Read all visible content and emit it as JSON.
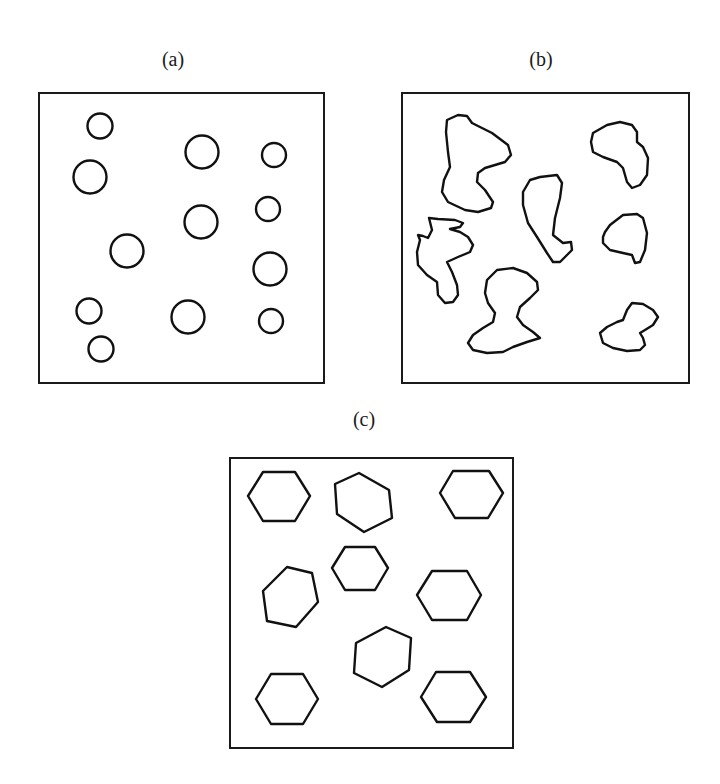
{
  "figure": {
    "stroke_color": "#111111",
    "background": "#ffffff",
    "panels": [
      {
        "id": "a",
        "label": "(a)",
        "label_pos": [
          173,
          66
        ],
        "frame": {
          "x": 39,
          "y": 93,
          "w": 285,
          "h": 290
        },
        "shape_type": "circle",
        "description": "regular circles",
        "circles": [
          {
            "cx": 100,
            "cy": 126,
            "r": 12.5
          },
          {
            "cx": 90,
            "cy": 177,
            "r": 16.5
          },
          {
            "cx": 202,
            "cy": 152,
            "r": 16.5
          },
          {
            "cx": 274,
            "cy": 155,
            "r": 12
          },
          {
            "cx": 201,
            "cy": 222,
            "r": 16.5
          },
          {
            "cx": 268,
            "cy": 209,
            "r": 12
          },
          {
            "cx": 127,
            "cy": 251,
            "r": 16.5
          },
          {
            "cx": 270,
            "cy": 269,
            "r": 16.5
          },
          {
            "cx": 89,
            "cy": 311,
            "r": 12.5
          },
          {
            "cx": 188,
            "cy": 317,
            "r": 16.5
          },
          {
            "cx": 271,
            "cy": 321,
            "r": 12
          },
          {
            "cx": 101,
            "cy": 349,
            "r": 12.5
          }
        ]
      },
      {
        "id": "b",
        "label": "(b)",
        "label_pos": [
          541,
          66
        ],
        "frame": {
          "x": 402,
          "y": 93,
          "w": 287,
          "h": 290
        },
        "shape_type": "blob",
        "description": "irregular blobs",
        "blobs": [
          {
            "points": [
              [
                447,
                120
              ],
              [
                458,
                115
              ],
              [
                467,
                116
              ],
              [
                472,
                123
              ],
              [
                492,
                133
              ],
              [
                508,
                145
              ],
              [
                511,
                155
              ],
              [
                505,
                162
              ],
              [
                485,
                168
              ],
              [
                478,
                173
              ],
              [
                477,
                182
              ],
              [
                485,
                190
              ],
              [
                493,
                202
              ],
              [
                491,
                208
              ],
              [
                478,
                212
              ],
              [
                465,
                210
              ],
              [
                448,
                202
              ],
              [
                442,
                192
              ],
              [
                444,
                180
              ],
              [
                450,
                167
              ],
              [
                448,
                152
              ],
              [
                446,
                132
              ]
            ]
          },
          {
            "points": [
              [
                429,
                218
              ],
              [
                438,
                219
              ],
              [
                455,
                220
              ],
              [
                463,
                223
              ],
              [
                460,
                227
              ],
              [
                450,
                229
              ],
              [
                460,
                232
              ],
              [
                468,
                237
              ],
              [
                473,
                245
              ],
              [
                470,
                252
              ],
              [
                458,
                257
              ],
              [
                447,
                262
              ],
              [
                452,
                272
              ],
              [
                457,
                285
              ],
              [
                458,
                295
              ],
              [
                453,
                302
              ],
              [
                445,
                303
              ],
              [
                438,
                295
              ],
              [
                437,
                282
              ],
              [
                427,
                275
              ],
              [
                418,
                265
              ],
              [
                417,
                252
              ],
              [
                420,
                240
              ],
              [
                418,
                235
              ],
              [
                423,
                236
              ],
              [
                428,
                238
              ],
              [
                432,
                230
              ]
            ]
          },
          {
            "points": [
              [
                530,
                180
              ],
              [
                540,
                177
              ],
              [
                557,
                175
              ],
              [
                562,
                183
              ],
              [
                560,
                198
              ],
              [
                555,
                218
              ],
              [
                553,
                235
              ],
              [
                563,
                243
              ],
              [
                571,
                242
              ],
              [
                572,
                250
              ],
              [
                567,
                255
              ],
              [
                560,
                262
              ],
              [
                553,
                262
              ],
              [
                547,
                253
              ],
              [
                537,
                237
              ],
              [
                528,
                223
              ],
              [
                523,
                205
              ],
              [
                523,
                192
              ]
            ]
          },
          {
            "points": [
              [
                593,
                133
              ],
              [
                607,
                125
              ],
              [
                620,
                122
              ],
              [
                632,
                125
              ],
              [
                637,
                132
              ],
              [
                637,
                142
              ],
              [
                643,
                147
              ],
              [
                648,
                158
              ],
              [
                647,
                175
              ],
              [
                640,
                185
              ],
              [
                632,
                188
              ],
              [
                627,
                182
              ],
              [
                623,
                168
              ],
              [
                617,
                162
              ],
              [
                603,
                157
              ],
              [
                593,
                152
              ],
              [
                591,
                142
              ]
            ]
          },
          {
            "points": [
              [
                605,
                232
              ],
              [
                610,
                225
              ],
              [
                623,
                215
              ],
              [
                637,
                214
              ],
              [
                643,
                218
              ],
              [
                647,
                233
              ],
              [
                645,
                250
              ],
              [
                640,
                262
              ],
              [
                635,
                263
              ],
              [
                632,
                255
              ],
              [
                623,
                253
              ],
              [
                610,
                250
              ],
              [
                603,
                243
              ],
              [
                603,
                237
              ]
            ]
          },
          {
            "points": [
              [
                600,
                333
              ],
              [
                607,
                327
              ],
              [
                617,
                322
              ],
              [
                623,
                320
              ],
              [
                627,
                310
              ],
              [
                632,
                303
              ],
              [
                643,
                304
              ],
              [
                653,
                310
              ],
              [
                658,
                317
              ],
              [
                653,
                325
              ],
              [
                645,
                330
              ],
              [
                640,
                333
              ],
              [
                643,
                338
              ],
              [
                645,
                345
              ],
              [
                640,
                350
              ],
              [
                627,
                351
              ],
              [
                613,
                348
              ],
              [
                603,
                343
              ]
            ]
          },
          {
            "points": [
              [
                487,
                280
              ],
              [
                497,
                270
              ],
              [
                513,
                268
              ],
              [
                527,
                273
              ],
              [
                537,
                282
              ],
              [
                538,
                290
              ],
              [
                530,
                298
              ],
              [
                520,
                307
              ],
              [
                517,
                317
              ],
              [
                523,
                325
              ],
              [
                533,
                332
              ],
              [
                540,
                338
              ],
              [
                527,
                342
              ],
              [
                513,
                347
              ],
              [
                503,
                352
              ],
              [
                487,
                353
              ],
              [
                473,
                350
              ],
              [
                468,
                343
              ],
              [
                473,
                335
              ],
              [
                483,
                328
              ],
              [
                493,
                322
              ],
              [
                495,
                313
              ],
              [
                488,
                303
              ],
              [
                485,
                293
              ]
            ]
          }
        ]
      },
      {
        "id": "c",
        "label": "(c)",
        "label_pos": [
          364,
          426
        ],
        "frame": {
          "x": 230,
          "y": 458,
          "w": 283,
          "h": 290
        },
        "shape_type": "hexagon",
        "description": "hexagons",
        "hexagons": [
          {
            "points": [
              [
                248,
                496
              ],
              [
                263,
                472
              ],
              [
                295,
                472
              ],
              [
                310,
                496
              ],
              [
                295,
                521
              ],
              [
                263,
                521
              ]
            ]
          },
          {
            "points": [
              [
                335,
                484
              ],
              [
                359,
                473
              ],
              [
                389,
                490
              ],
              [
                392,
                518
              ],
              [
                364,
                532
              ],
              [
                337,
                514
              ]
            ]
          },
          {
            "points": [
              [
                440,
                493
              ],
              [
                453,
                471
              ],
              [
                489,
                471
              ],
              [
                503,
                493
              ],
              [
                488,
                518
              ],
              [
                455,
                518
              ]
            ]
          },
          {
            "points": [
              [
                332,
                568
              ],
              [
                345,
                547
              ],
              [
                375,
                547
              ],
              [
                388,
                568
              ],
              [
                375,
                590
              ],
              [
                345,
                590
              ]
            ]
          },
          {
            "points": [
              [
                263,
                591
              ],
              [
                287,
                567
              ],
              [
                312,
                573
              ],
              [
                318,
                602
              ],
              [
                296,
                627
              ],
              [
                267,
                621
              ]
            ]
          },
          {
            "points": [
              [
                417,
                595
              ],
              [
                432,
                571
              ],
              [
                467,
                571
              ],
              [
                481,
                595
              ],
              [
                467,
                620
              ],
              [
                432,
                620
              ]
            ]
          },
          {
            "points": [
              [
                356,
                643
              ],
              [
                386,
                627
              ],
              [
                411,
                638
              ],
              [
                409,
                670
              ],
              [
                382,
                687
              ],
              [
                354,
                673
              ]
            ]
          },
          {
            "points": [
              [
                256,
                699
              ],
              [
                271,
                674
              ],
              [
                303,
                674
              ],
              [
                318,
                699
              ],
              [
                303,
                724
              ],
              [
                271,
                724
              ]
            ]
          },
          {
            "points": [
              [
                421,
                697
              ],
              [
                436,
                672
              ],
              [
                470,
                672
              ],
              [
                486,
                697
              ],
              [
                470,
                722
              ],
              [
                437,
                722
              ]
            ]
          }
        ]
      }
    ]
  }
}
